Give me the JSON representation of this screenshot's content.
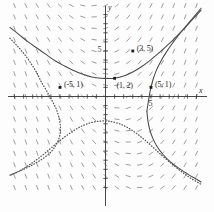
{
  "chart_data": {
    "type": "line",
    "title": "",
    "xlabel": "x",
    "ylabel": "y",
    "xlim": [
      -10.5,
      10.5
    ],
    "ylim": [
      -10.5,
      10.5
    ],
    "grid": false,
    "legend": "none",
    "axis_tick_labels": [
      {
        "axis": "y",
        "value": 5,
        "text": "5"
      },
      {
        "axis": "x",
        "value": 5,
        "text": "5"
      }
    ],
    "annotations": [
      {
        "text": "(3, 5)",
        "x": 3,
        "y": 5,
        "marker": "dot"
      },
      {
        "text": "(1, 2)",
        "x": 1,
        "y": 2,
        "marker": "dot"
      },
      {
        "text": "(-5, 1)",
        "x": -5,
        "y": 1,
        "marker": "dot"
      },
      {
        "text": "(5, 1)",
        "x": 5,
        "y": 1,
        "marker": "dot"
      }
    ],
    "series": [
      {
        "name": "solution-through-(1,2)",
        "style": "solid",
        "color": "#4a4a4a",
        "points": [
          [
            -10.5,
            7.6
          ],
          [
            -9.5,
            6.8
          ],
          [
            -8.5,
            6.0
          ],
          [
            -7.5,
            5.3
          ],
          [
            -6.5,
            4.6
          ],
          [
            -5.5,
            3.9
          ],
          [
            -4.5,
            3.35
          ],
          [
            -3.5,
            2.85
          ],
          [
            -2.5,
            2.45
          ],
          [
            -1.5,
            2.15
          ],
          [
            -0.5,
            2.0
          ],
          [
            0.35,
            1.97
          ],
          [
            1.0,
            2.0
          ],
          [
            2.0,
            2.25
          ],
          [
            3.0,
            2.7
          ],
          [
            4.0,
            3.3
          ],
          [
            5.0,
            4.05
          ],
          [
            6.0,
            4.9
          ],
          [
            7.0,
            5.8
          ],
          [
            8.0,
            6.8
          ],
          [
            9.0,
            7.85
          ],
          [
            10.0,
            8.95
          ],
          [
            10.5,
            9.5
          ]
        ]
      },
      {
        "name": "solution-through-(5,1)",
        "style": "solid",
        "color": "#4a4a4a",
        "points": [
          [
            4.55,
            -1.6
          ],
          [
            4.7,
            -0.6
          ],
          [
            4.85,
            0.3
          ],
          [
            5.0,
            1.0
          ],
          [
            5.25,
            1.95
          ],
          [
            5.6,
            2.9
          ],
          [
            6.1,
            3.9
          ],
          [
            6.7,
            4.9
          ],
          [
            7.4,
            5.9
          ],
          [
            8.2,
            6.95
          ],
          [
            9.1,
            8.05
          ],
          [
            10.0,
            9.1
          ],
          [
            10.5,
            9.7
          ]
        ]
      },
      {
        "name": "solution-through-(5,1)-lower-branch",
        "style": "solid",
        "color": "#4a4a4a",
        "points": [
          [
            4.55,
            -1.6
          ],
          [
            4.65,
            -2.6
          ],
          [
            4.85,
            -3.6
          ],
          [
            5.2,
            -4.6
          ],
          [
            5.7,
            -5.55
          ],
          [
            6.35,
            -6.4
          ],
          [
            7.1,
            -7.15
          ],
          [
            8.0,
            -7.85
          ],
          [
            9.0,
            -8.5
          ],
          [
            10.0,
            -9.1
          ],
          [
            10.5,
            -9.4
          ]
        ]
      },
      {
        "name": "solution-through-(-5,1)-dotted",
        "style": "dotted",
        "color": "#555555",
        "points": [
          [
            -10.5,
            6.4
          ],
          [
            -9.6,
            5.45
          ],
          [
            -8.8,
            4.5
          ],
          [
            -8.1,
            3.5
          ],
          [
            -7.5,
            2.5
          ],
          [
            -7.0,
            1.5
          ],
          [
            -6.4,
            0.5
          ],
          [
            -5.85,
            -0.5
          ],
          [
            -5.4,
            -1.4
          ],
          [
            -5.1,
            -2.4
          ],
          [
            -4.95,
            -3.4
          ],
          [
            -5.05,
            -4.4
          ],
          [
            -5.45,
            -5.35
          ],
          [
            -6.1,
            -6.2
          ],
          [
            -7.0,
            -6.9
          ],
          [
            -8.0,
            -7.5
          ],
          [
            -9.0,
            -8.0
          ],
          [
            -10.0,
            -8.45
          ],
          [
            -10.5,
            -8.65
          ]
        ]
      },
      {
        "name": "solution-lower-dotted-arc",
        "style": "dotted",
        "color": "#555555",
        "points": [
          [
            -10.5,
            -8.65
          ],
          [
            -9.5,
            -8.2
          ],
          [
            -8.5,
            -7.6
          ],
          [
            -7.5,
            -6.9
          ],
          [
            -6.5,
            -6.1
          ],
          [
            -5.5,
            -5.25
          ],
          [
            -4.5,
            -4.45
          ],
          [
            -3.5,
            -3.75
          ],
          [
            -2.5,
            -3.2
          ],
          [
            -1.5,
            -2.85
          ],
          [
            -0.5,
            -2.7
          ],
          [
            0.4,
            -2.72
          ],
          [
            1.4,
            -2.95
          ],
          [
            2.4,
            -3.4
          ],
          [
            3.4,
            -4.05
          ],
          [
            4.4,
            -4.85
          ],
          [
            5.4,
            -5.75
          ],
          [
            6.4,
            -6.65
          ],
          [
            7.4,
            -7.5
          ],
          [
            8.4,
            -8.3
          ],
          [
            9.4,
            -9.0
          ],
          [
            10.5,
            -9.65
          ]
        ]
      }
    ],
    "slope_field": {
      "description": "direction field of short dashes",
      "color": "#8d8d8d",
      "x_range": [
        -10,
        10
      ],
      "y_range": [
        -10,
        10
      ],
      "step": 1.25
    }
  }
}
